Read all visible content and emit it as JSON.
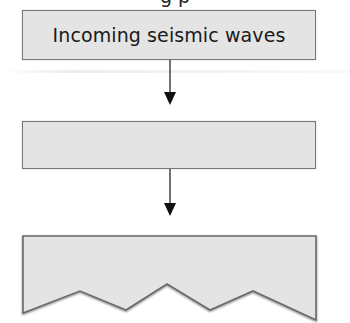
{
  "diagram": {
    "top_cut_heading": "g p",
    "boxes": [
      {
        "id": "box1",
        "label": "Incoming seismic waves",
        "shape": "rectangle"
      },
      {
        "id": "box2",
        "label": "",
        "shape": "rectangle"
      },
      {
        "id": "box3",
        "label": "",
        "shape": "zigzag-bottom"
      }
    ],
    "arrows": [
      {
        "from": "box1",
        "to": "box2"
      },
      {
        "from": "box2",
        "to": "box3"
      }
    ],
    "colors": {
      "box_fill": "#e4e4e4",
      "box_border": "#777777",
      "arrow": "#333333",
      "text": "#1a1a1a"
    }
  }
}
